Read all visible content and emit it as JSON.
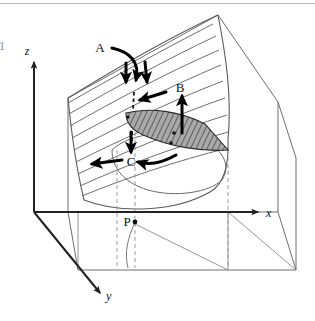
{
  "figure": {
    "domain_note": "3D perspective diagram of a curved surface over an x-y base plane",
    "width": 315,
    "height": 321,
    "background_color": "#ffffff",
    "top_border_color": "#b5b5b5"
  },
  "axes": {
    "z_label": "z",
    "x_label": "x",
    "y_label": "y",
    "axis_color": "#222222",
    "axis_line_width": 2
  },
  "labels": {
    "a": "A",
    "b": "B",
    "c": "C",
    "p": "P",
    "clipped_left_edge": "1"
  },
  "surface": {
    "line_color": "#555555",
    "contour_count": 9,
    "frame_color": "#6e6e6e"
  },
  "shaded_region": {
    "name": "hatched-wedge",
    "fill_color": "#a8a8a8",
    "hatch_color": "#3a3a3a",
    "outline_color": "#2b2b2b"
  },
  "arrows": {
    "color": "#000000",
    "stroke_width": 3,
    "items": [
      {
        "name": "arrow-a-curved",
        "label": "A",
        "direction": "curved-down"
      },
      {
        "name": "arrow-a-down-left",
        "label": "A",
        "direction": "down"
      },
      {
        "name": "arrow-a-down-right",
        "label": "A",
        "direction": "down-right"
      },
      {
        "name": "arrow-b-up",
        "label": "B",
        "direction": "up"
      },
      {
        "name": "arrow-b-left",
        "label": "B",
        "direction": "left"
      },
      {
        "name": "arrow-c-down",
        "label": "C",
        "direction": "down"
      },
      {
        "name": "arrow-c-left",
        "label": "C",
        "direction": "left"
      },
      {
        "name": "arrow-c-curved",
        "label": "C",
        "direction": "curved-left"
      }
    ]
  },
  "dashed_lines": {
    "color": "#9a9a9a",
    "dash_pattern": "4,3"
  },
  "points": {
    "p_dot_color": "#111111",
    "markers": [
      "P",
      "surface-dot-1",
      "surface-dot-2"
    ]
  }
}
